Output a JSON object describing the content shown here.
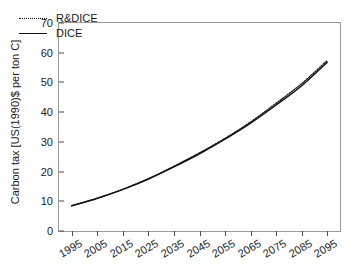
{
  "chart_data": {
    "type": "line",
    "title": "",
    "xlabel": "",
    "ylabel": "Carbon tax [US(1990)$ per ton C]",
    "x": [
      1995,
      2005,
      2015,
      2025,
      2035,
      2045,
      2055,
      2065,
      2075,
      2085,
      2095
    ],
    "categories": [
      "1995",
      "2005",
      "2015",
      "2025",
      "2035",
      "2045",
      "2055",
      "2065",
      "2075",
      "2085",
      "2095"
    ],
    "series": [
      {
        "name": "R&DICE",
        "style": "dotted",
        "color": "#111111",
        "values": [
          8.5,
          11.0,
          14.0,
          17.6,
          21.8,
          26.3,
          31.2,
          36.7,
          43.0,
          49.6,
          57.4
        ]
      },
      {
        "name": "DICE",
        "style": "solid",
        "color": "#111111",
        "values": [
          8.5,
          11.0,
          14.0,
          17.5,
          21.6,
          26.0,
          30.9,
          36.3,
          42.4,
          48.9,
          56.8
        ]
      }
    ],
    "yticks": [
      0,
      10,
      20,
      30,
      40,
      50,
      60,
      70
    ],
    "ylim": [
      0,
      70
    ],
    "xlim": [
      1990,
      2100
    ],
    "grid": false,
    "legend_position": "upper-left-inside",
    "legend_entries": [
      "R&DICE",
      "DICE"
    ],
    "axis_color": "#9a9a9a",
    "tick_color": "#4d4d4d",
    "background_color": "#ffffff"
  },
  "axes": {
    "y_title": "Carbon tax [US(1990)$ per ton C]"
  },
  "legend": {
    "items": [
      {
        "label": "R&DICE",
        "style": "dotted"
      },
      {
        "label": "DICE",
        "style": "solid"
      }
    ]
  }
}
